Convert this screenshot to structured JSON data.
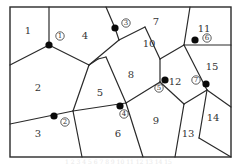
{
  "diagram": {
    "type": "map-partition",
    "frame": {
      "x": 10,
      "y": 7,
      "width": 221,
      "height": 150
    },
    "regions": [
      {
        "id": "1",
        "label": "1",
        "x": 28,
        "y": 31
      },
      {
        "id": "2",
        "label": "2",
        "x": 38,
        "y": 88
      },
      {
        "id": "3",
        "label": "3",
        "x": 38,
        "y": 134
      },
      {
        "id": "4",
        "label": "4",
        "x": 85,
        "y": 36
      },
      {
        "id": "5",
        "label": "5",
        "x": 100,
        "y": 93
      },
      {
        "id": "6",
        "label": "6",
        "x": 118,
        "y": 134
      },
      {
        "id": "7",
        "label": "7",
        "x": 156,
        "y": 22
      },
      {
        "id": "8",
        "label": "8",
        "x": 131,
        "y": 75
      },
      {
        "id": "9",
        "label": "9",
        "x": 156,
        "y": 121
      },
      {
        "id": "10",
        "label": "10",
        "x": 149,
        "y": 44
      },
      {
        "id": "11",
        "label": "11",
        "x": 204,
        "y": 29
      },
      {
        "id": "12",
        "label": "12",
        "x": 175,
        "y": 82
      },
      {
        "id": "13",
        "label": "13",
        "x": 188,
        "y": 134
      },
      {
        "id": "14",
        "label": "14",
        "x": 213,
        "y": 118
      },
      {
        "id": "15",
        "label": "15",
        "x": 212,
        "y": 67
      }
    ],
    "points": [
      {
        "id": "1",
        "label": "①",
        "x": 49,
        "y": 45,
        "lx": 60,
        "ly": 36
      },
      {
        "id": "2",
        "label": "②",
        "x": 54,
        "y": 116,
        "lx": 65,
        "ly": 122
      },
      {
        "id": "3",
        "label": "③",
        "x": 115,
        "y": 28,
        "lx": 126,
        "ly": 23
      },
      {
        "id": "4",
        "label": "④",
        "x": 120,
        "y": 106,
        "lx": 124,
        "ly": 114
      },
      {
        "id": "5",
        "label": "⑤",
        "x": 165,
        "y": 80,
        "lx": 159,
        "ly": 88
      },
      {
        "id": "6",
        "label": "⑥",
        "x": 195,
        "y": 40,
        "lx": 207,
        "ly": 38
      },
      {
        "id": "7",
        "label": "⑦",
        "x": 206,
        "y": 84,
        "lx": 196,
        "ly": 80
      }
    ],
    "edges": [
      [
        49,
        7,
        49,
        45
      ],
      [
        49,
        45,
        10,
        65
      ],
      [
        49,
        45,
        89,
        65
      ],
      [
        89,
        65,
        98,
        59
      ],
      [
        98,
        59,
        106,
        57
      ],
      [
        106,
        7,
        115,
        28
      ],
      [
        115,
        28,
        119,
        40
      ],
      [
        119,
        40,
        145,
        27
      ],
      [
        145,
        27,
        160,
        59
      ],
      [
        119,
        40,
        89,
        65
      ],
      [
        160,
        59,
        184,
        45
      ],
      [
        190,
        7,
        184,
        45
      ],
      [
        184,
        45,
        231,
        45
      ],
      [
        160,
        59,
        160,
        82
      ],
      [
        160,
        82,
        126,
        103
      ],
      [
        106,
        57,
        126,
        103
      ],
      [
        184,
        45,
        207,
        90
      ],
      [
        207,
        90,
        231,
        107
      ],
      [
        160,
        82,
        184,
        104
      ],
      [
        184,
        104,
        207,
        90
      ],
      [
        207,
        90,
        199,
        138
      ],
      [
        199,
        138,
        231,
        157
      ],
      [
        184,
        104,
        175,
        157
      ],
      [
        126,
        103,
        143,
        157
      ],
      [
        126,
        103,
        73,
        111
      ],
      [
        89,
        65,
        73,
        111
      ],
      [
        73,
        111,
        10,
        124
      ],
      [
        73,
        111,
        82,
        157
      ]
    ]
  },
  "caption": {
    "text": "1 2 3 4 5 6 7 8 9 10 11 12 13 14 15"
  }
}
